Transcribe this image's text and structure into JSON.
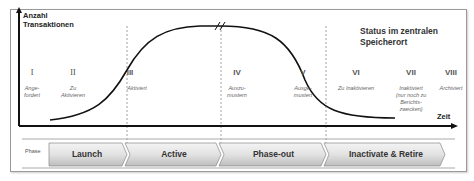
{
  "diagram": {
    "y_axis_label": [
      "Anzahl",
      "Transaktionen"
    ],
    "x_axis_label": "Zeit",
    "status_title": [
      "Status im zentralen",
      "Speicherort"
    ],
    "stages": [
      {
        "numeral": "I",
        "text": [
          "Ange-",
          "fordert"
        ]
      },
      {
        "numeral": "II",
        "text": [
          "Zu",
          "Aktivieren"
        ]
      },
      {
        "numeral": "III",
        "text": [
          "Aktiviert"
        ]
      },
      {
        "numeral": "IV",
        "text": [
          "Auszu-",
          "mustern"
        ]
      },
      {
        "numeral": "V",
        "text": [
          "Ausge-",
          "mustert"
        ]
      },
      {
        "numeral": "VI",
        "text": [
          "Zu Inaktivieren"
        ]
      },
      {
        "numeral": "VII",
        "text": [
          "Inaktiviert",
          "(nur noch zu",
          "Berichts-",
          "zwecken)"
        ]
      },
      {
        "numeral": "VIII",
        "text": [
          "Archiviert"
        ]
      }
    ],
    "phase_label": "Phase",
    "phases": [
      "Launch",
      "Active",
      "Phase-out",
      "Inactivate & Retire"
    ]
  }
}
